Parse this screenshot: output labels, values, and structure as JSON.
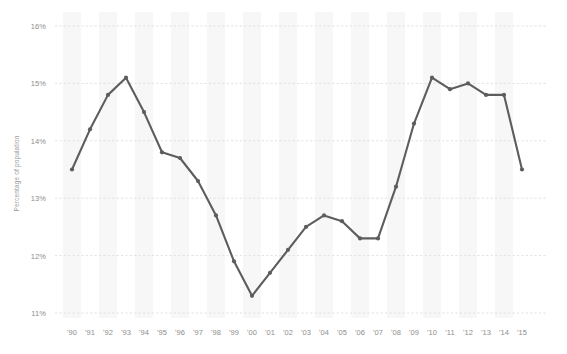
{
  "chart_data": {
    "type": "line",
    "title": "",
    "subtitle": "",
    "xlabel": "",
    "ylabel": "Percentage of population",
    "categories": [
      "'90",
      "'91",
      "'92",
      "'93",
      "'94",
      "'95",
      "'96",
      "'97",
      "'98",
      "'99",
      "'00",
      "'01",
      "'02",
      "'03",
      "'04",
      "'05",
      "'06",
      "'07",
      "'08",
      "'09",
      "'10",
      "'11",
      "'12",
      "'13",
      "'14",
      "'15"
    ],
    "values": [
      13.5,
      14.2,
      14.8,
      15.1,
      14.5,
      13.8,
      13.7,
      13.3,
      12.7,
      11.9,
      11.3,
      11.7,
      12.1,
      12.5,
      12.7,
      12.6,
      12.3,
      12.3,
      13.2,
      14.3,
      15.1,
      14.9,
      15.0,
      14.8,
      14.8,
      13.5
    ],
    "ylim": [
      11,
      16
    ],
    "ytick_labels": [
      "16%",
      "15%",
      "14%",
      "13%",
      "12%",
      "11%"
    ],
    "ytick_values": [
      16,
      15,
      14,
      13,
      12,
      11
    ],
    "grid": true,
    "legend": "none",
    "series_name": "Percentage of population",
    "colors": {
      "line": "#5d5d5d",
      "marker": "#5d5d5d",
      "grid": "#dedede",
      "band": "#f7f7f7",
      "axis_text": "#8d8d8d",
      "axis_title": "#9a9a9a",
      "background": "#ffffff"
    }
  }
}
